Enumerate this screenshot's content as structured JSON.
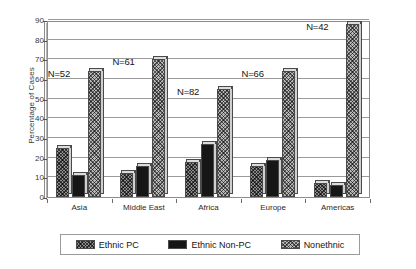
{
  "chart_data": {
    "type": "bar",
    "title": "",
    "xlabel": "",
    "ylabel": "Percentage of Cases",
    "ylim": [
      0,
      90
    ],
    "ytick_values": [
      90,
      80,
      70,
      60,
      50,
      40,
      30,
      20,
      10,
      0
    ],
    "grid": true,
    "legend_position": "bottom",
    "categories": [
      "Asia",
      "Middle East",
      "Africa",
      "Europe",
      "Americas"
    ],
    "series": [
      {
        "name": "Ethnic PC",
        "values": [
          25,
          12,
          18,
          16,
          7
        ]
      },
      {
        "name": "Ethnic Non-PC",
        "values": [
          11,
          16,
          27,
          19,
          6
        ]
      },
      {
        "name": "Nonethnic",
        "values": [
          64,
          70,
          55,
          64,
          88
        ]
      }
    ],
    "annotations": [
      {
        "text": "N=52",
        "category": "Asia"
      },
      {
        "text": "N=61",
        "category": "Middle East"
      },
      {
        "text": "N=82",
        "category": "Africa"
      },
      {
        "text": "N=66",
        "category": "Europe"
      },
      {
        "text": "N=42",
        "category": "Americas"
      }
    ]
  },
  "axis": {
    "ylabel": "Percentage of Cases",
    "yticks": [
      "90",
      "80",
      "70",
      "60",
      "50",
      "40",
      "30",
      "20",
      "10",
      "0"
    ],
    "xticks": [
      "Asia",
      "Middle East",
      "Africa",
      "Europe",
      "Americas"
    ]
  },
  "annotations": {
    "asia": "N=52",
    "middle_east": "N=61",
    "africa": "N=82",
    "europe": "N=66",
    "americas": "N=42"
  },
  "legend": {
    "items": [
      {
        "label": "Ethnic PC",
        "pattern": "cross-hatch-dark"
      },
      {
        "label": "Ethnic Non-PC",
        "pattern": "solid-black"
      },
      {
        "label": "Nonethnic",
        "pattern": "cross-hatch-light"
      }
    ]
  },
  "colors": {
    "ethnic_pc": "#8f8f8f",
    "ethnic_non_pc": "#161616",
    "nonethnic": "#b9b9b9",
    "gridline": "#9a9a9a",
    "axis": "#8c8c8c",
    "text": "#141414"
  }
}
